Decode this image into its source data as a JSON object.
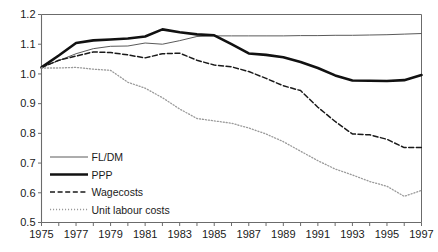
{
  "chart_data": {
    "type": "line",
    "title": "",
    "subtitle": "",
    "xlabel": "",
    "ylabel": "",
    "xlim": [
      1975,
      1997
    ],
    "ylim": [
      0.5,
      1.2
    ],
    "grid": false,
    "legend_position": "bottom-left-inside",
    "x": [
      1975,
      1976,
      1977,
      1978,
      1979,
      1980,
      1981,
      1982,
      1983,
      1984,
      1985,
      1986,
      1987,
      1988,
      1989,
      1990,
      1991,
      1992,
      1993,
      1994,
      1995,
      1996,
      1997
    ],
    "y_ticks": [
      0.5,
      0.6,
      0.7,
      0.8,
      0.9,
      1.0,
      1.1,
      1.2
    ],
    "y_tick_labels": [
      "0.5",
      "0.6",
      "0.7",
      "0.8",
      "0.9",
      "1.0",
      "1.1",
      "1.2"
    ],
    "x_ticks": [
      1975,
      1976,
      1977,
      1978,
      1979,
      1980,
      1981,
      1982,
      1983,
      1984,
      1985,
      1986,
      1987,
      1988,
      1989,
      1990,
      1991,
      1992,
      1993,
      1994,
      1995,
      1996,
      1997
    ],
    "x_tick_labels": [
      "1975",
      "",
      "1977",
      "",
      "1979",
      "",
      "1981",
      "",
      "1983",
      "",
      "1985",
      "",
      "1987",
      "",
      "1989",
      "",
      "1991",
      "",
      "1993",
      "",
      "1995",
      "",
      "1997"
    ],
    "series": [
      {
        "name": "FL/DM",
        "style": "solid-thin",
        "color": "#5a5a5a",
        "values": [
          1.022,
          1.045,
          1.068,
          1.085,
          1.093,
          1.094,
          1.104,
          1.1,
          1.112,
          1.126,
          1.128,
          1.128,
          1.128,
          1.128,
          1.128,
          1.129,
          1.129,
          1.13,
          1.13,
          1.131,
          1.132,
          1.134,
          1.136
        ]
      },
      {
        "name": "PPP",
        "style": "solid-thick",
        "color": "#111111",
        "values": [
          1.022,
          1.062,
          1.104,
          1.113,
          1.116,
          1.119,
          1.126,
          1.15,
          1.14,
          1.133,
          1.13,
          1.1,
          1.069,
          1.064,
          1.056,
          1.04,
          1.02,
          0.995,
          0.978,
          0.977,
          0.976,
          0.979,
          0.996
        ]
      },
      {
        "name": "Wagecosts",
        "style": "dashed",
        "color": "#1a1a1a",
        "values": [
          1.022,
          1.046,
          1.06,
          1.074,
          1.072,
          1.064,
          1.054,
          1.068,
          1.07,
          1.046,
          1.03,
          1.024,
          1.008,
          0.985,
          0.96,
          0.944,
          0.888,
          0.84,
          0.798,
          0.795,
          0.78,
          0.752,
          0.752
        ]
      },
      {
        "name": "Unit labour costs",
        "style": "dotted",
        "color": "#9a9a9a",
        "values": [
          1.02,
          1.02,
          1.022,
          1.016,
          1.012,
          0.972,
          0.952,
          0.92,
          0.882,
          0.85,
          0.842,
          0.834,
          0.818,
          0.798,
          0.772,
          0.74,
          0.708,
          0.68,
          0.66,
          0.638,
          0.622,
          0.588,
          0.608
        ]
      }
    ]
  },
  "legend": {
    "items": [
      {
        "label": "FL/DM"
      },
      {
        "label": "PPP"
      },
      {
        "label": "Wagecosts"
      },
      {
        "label": "Unit labour costs"
      }
    ]
  },
  "colors": {
    "axis": "#6b6b6b",
    "text": "#1a1a1a",
    "background": "#ffffff"
  }
}
